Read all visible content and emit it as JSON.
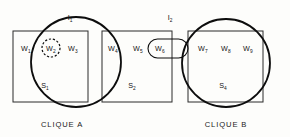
{
  "figure": {
    "background_color": "#fdfdfb",
    "stroke_color": "#0d0d0d",
    "box_stroke_color": "#2b2b2b"
  },
  "isomorphism_labels": [
    {
      "id": "I1",
      "base": "I",
      "sub": "1",
      "x": 70,
      "y": 20
    },
    {
      "id": "I2",
      "base": "I",
      "sub": "2",
      "x": 170,
      "y": 20
    }
  ],
  "sets": [
    {
      "id": "S1",
      "base": "S",
      "sub": "1",
      "label_x": 45,
      "label_y": 88,
      "box": {
        "x": 13,
        "y": 31,
        "width": 75,
        "height": 71
      }
    },
    {
      "id": "S2",
      "base": "S",
      "sub": "2",
      "label_x": 132,
      "label_y": 88,
      "box": {
        "x": 102,
        "y": 31,
        "width": 70,
        "height": 71
      }
    },
    {
      "id": "S4",
      "base": "S",
      "sub": "4",
      "label_x": 223,
      "label_y": 88,
      "box": {
        "x": 188,
        "y": 31,
        "width": 75,
        "height": 71
      }
    }
  ],
  "circles": [
    {
      "id": "I1-circle",
      "cx": 76,
      "cy": 62,
      "r": 45
    },
    {
      "id": "I2-circle",
      "cx": 226,
      "cy": 63,
      "r": 44
    }
  ],
  "nodes": [
    {
      "id": "W1",
      "base": "W",
      "sub": "1",
      "x": 26,
      "y": 51,
      "highlighted": false
    },
    {
      "id": "W2",
      "base": "W",
      "sub": "2",
      "x": 51,
      "y": 51,
      "highlighted": true
    },
    {
      "id": "W3",
      "base": "W",
      "sub": "3",
      "x": 73,
      "y": 51,
      "highlighted": false
    },
    {
      "id": "W4",
      "base": "W",
      "sub": "4",
      "x": 113,
      "y": 51,
      "highlighted": false
    },
    {
      "id": "W5",
      "base": "W",
      "sub": "5",
      "x": 138,
      "y": 51,
      "highlighted": false
    },
    {
      "id": "W6",
      "base": "W",
      "sub": "6",
      "x": 160,
      "y": 51,
      "highlighted": false
    },
    {
      "id": "W7",
      "base": "W",
      "sub": "7",
      "x": 203,
      "y": 51,
      "highlighted": false
    },
    {
      "id": "W8",
      "base": "W",
      "sub": "8",
      "x": 226,
      "y": 51,
      "highlighted": false
    },
    {
      "id": "W9",
      "base": "W",
      "sub": "9",
      "x": 248,
      "y": 51,
      "highlighted": false
    }
  ],
  "highlight_circle": {
    "cx": 51,
    "cy": 48,
    "r": 9
  },
  "capsule": {
    "x": 148,
    "y": 39,
    "width": 40,
    "height": 19,
    "rx": 9.5
  },
  "captions": [
    {
      "id": "clique-a",
      "text": "CLIQUE A",
      "x": 62,
      "y": 127
    },
    {
      "id": "clique-b",
      "text": "CLIQUE B",
      "x": 226,
      "y": 127
    }
  ]
}
